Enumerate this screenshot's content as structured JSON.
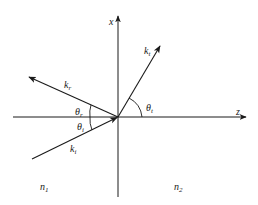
{
  "diagram": {
    "axes": {
      "x_label": "x",
      "z_label": "z"
    },
    "vectors": {
      "incident": {
        "label": "k",
        "sub": "i"
      },
      "reflected": {
        "label": "k",
        "sub": "r"
      },
      "transmitted": {
        "label": "k",
        "sub": "t"
      }
    },
    "angles": {
      "incident": {
        "label": "θ",
        "sub": "i"
      },
      "reflected": {
        "label": "θ",
        "sub": "r"
      },
      "transmitted": {
        "label": "θ",
        "sub": "t"
      }
    },
    "media": {
      "left": {
        "label": "n",
        "sub": "1"
      },
      "right": {
        "label": "n",
        "sub": "2"
      }
    },
    "colors": {
      "stroke": "#1a1a1a",
      "background": "#ffffff"
    }
  }
}
